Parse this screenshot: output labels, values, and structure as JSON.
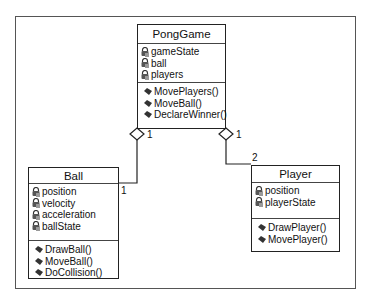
{
  "diagram": {
    "type": "uml-class-diagram",
    "classes": [
      {
        "name": "PongGame",
        "attributes": [
          "gameState",
          "ball",
          "players"
        ],
        "methods": [
          "MovePlayers()",
          "MoveBall()",
          "DeclareWinner()"
        ]
      },
      {
        "name": "Ball",
        "attributes": [
          "position",
          "velocity",
          "acceleration",
          "ballState"
        ],
        "methods": [
          "DrawBall()",
          "MoveBall()",
          "DoCollision()"
        ]
      },
      {
        "name": "Player",
        "attributes": [
          "position",
          "playerState"
        ],
        "methods": [
          "DrawPlayer()",
          "MovePlayer()"
        ]
      }
    ],
    "relationships": [
      {
        "type": "aggregation",
        "from": "PongGame",
        "to": "Ball",
        "from_multiplicity": "1",
        "to_multiplicity": "1"
      },
      {
        "type": "aggregation",
        "from": "PongGame",
        "to": "Player",
        "from_multiplicity": "1",
        "to_multiplicity": "2"
      }
    ],
    "icons": {
      "attribute": "private-field-lock-icon",
      "method": "method-diamond-icon"
    },
    "colors": {
      "line": "#222222",
      "frame": "#555555",
      "background": "#ffffff"
    }
  }
}
